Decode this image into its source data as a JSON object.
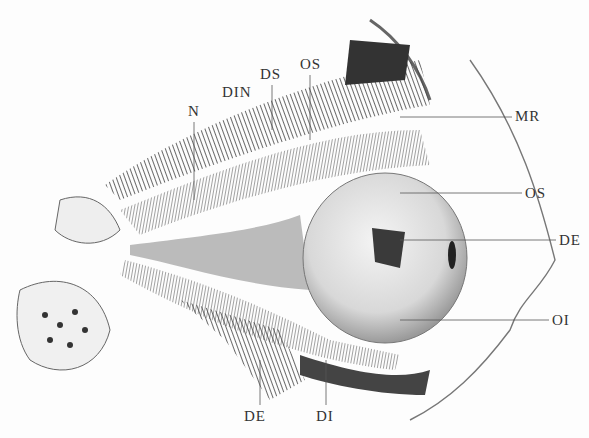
{
  "figure": {
    "labels": [
      {
        "id": "N",
        "text": "N",
        "x": 188,
        "y": 103
      },
      {
        "id": "DIN",
        "text": "DIN",
        "x": 222,
        "y": 84
      },
      {
        "id": "DS",
        "text": "DS",
        "x": 260,
        "y": 66
      },
      {
        "id": "OS_top",
        "text": "OS",
        "x": 300,
        "y": 56
      },
      {
        "id": "MR",
        "text": "MR",
        "x": 515,
        "y": 110
      },
      {
        "id": "OS_right",
        "text": "OS",
        "x": 525,
        "y": 187
      },
      {
        "id": "DE_right",
        "text": "DE",
        "x": 559,
        "y": 234
      },
      {
        "id": "OI",
        "text": "OI",
        "x": 552,
        "y": 314
      },
      {
        "id": "DE_bottom",
        "text": "DE",
        "x": 244,
        "y": 408
      },
      {
        "id": "DI",
        "text": "DI",
        "x": 316,
        "y": 408
      }
    ]
  }
}
